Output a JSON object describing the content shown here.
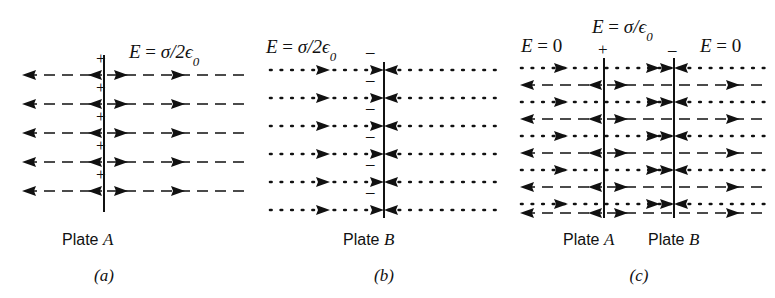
{
  "figure": {
    "title_present": false,
    "background_color": "#ffffff",
    "ink_color": "#111111"
  },
  "panels": [
    {
      "id": "a",
      "caption": "(a)",
      "field_label": "E = σ/2ϵ₀",
      "field_label_parts": {
        "symbol": "E",
        "equals": "=",
        "value": "σ/2ϵ",
        "subscript": "0"
      },
      "plate_label_word": "Plate",
      "plate_label_letter": "A",
      "plate_charge_sign": "+",
      "charge_sign_count": 5,
      "row_count": 5,
      "left_field_direction": "left",
      "right_field_direction": "right",
      "line_style": "dashed",
      "left_region_label": "",
      "right_region_label": ""
    },
    {
      "id": "b",
      "caption": "(b)",
      "field_label": "E = σ/2ϵ₀",
      "field_label_parts": {
        "symbol": "E",
        "equals": "=",
        "value": "σ/2ϵ",
        "subscript": "0"
      },
      "plate_label_word": "Plate",
      "plate_label_letter": "B",
      "plate_charge_sign": "−",
      "charge_sign_count": 5,
      "row_count": 6,
      "left_field_direction": "right",
      "right_field_direction": "left",
      "line_style": "dotted",
      "left_region_label": "",
      "right_region_label": ""
    },
    {
      "id": "c",
      "caption": "(c)",
      "field_label": "E = σ/ϵ₀",
      "field_label_parts": {
        "symbol": "E",
        "equals": "=",
        "value": "σ/ϵ",
        "subscript": "0"
      },
      "outer_left_label": "E = 0",
      "outer_right_label": "E = 0",
      "plate_a_label_word": "Plate",
      "plate_a_label_letter": "A",
      "plate_b_label_word": "Plate",
      "plate_b_label_letter": "B",
      "plate_a_charge_sign": "+",
      "plate_b_charge_sign": "−",
      "row_count_dotted": 6,
      "row_count_dashed": 5,
      "line_style": "dotted+dashed"
    }
  ],
  "geometry": {
    "panel_a": {
      "plate_x": 104,
      "top_y": 55,
      "bottom_y": 212,
      "left_x": 22,
      "right_x": 248
    },
    "panel_b": {
      "plate_x": 384,
      "top_y": 62,
      "bottom_y": 218,
      "left_x": 268,
      "right_x": 500
    },
    "panel_c": {
      "plate_a_x": 604,
      "plate_b_x": 674,
      "top_y": 58,
      "bottom_y": 218,
      "left_x": 520,
      "right_x": 768
    }
  }
}
